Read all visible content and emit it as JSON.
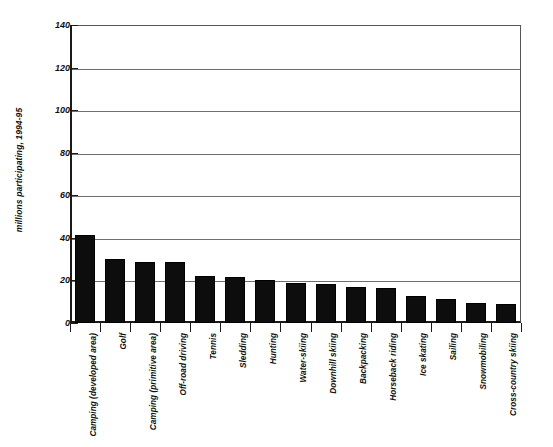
{
  "chart_data": {
    "type": "bar",
    "title": "",
    "xlabel": "",
    "ylabel": "millions participating, 1994-95",
    "ylim": [
      0,
      140
    ],
    "yticks": [
      0,
      20,
      40,
      60,
      80,
      100,
      120,
      140
    ],
    "ytick_labels": [
      "0",
      "20",
      "40",
      "60",
      "80",
      "100",
      "120",
      "140"
    ],
    "grid": "horizontal",
    "legend": "none",
    "orientation": "vertical",
    "bar_color": "#0d0d0d",
    "categories": [
      "Camping (developed area)",
      "Golf",
      "Camping (primitive area)",
      "Off-road driving",
      "Tennis",
      "Sledding",
      "Hunting",
      "Water-skiing",
      "Downhill skiing",
      "Backpacking",
      "Horseback riding",
      "Ice skating",
      "Sailing",
      "Snowmobiling",
      "Cross-country skiing"
    ],
    "values": [
      41.5,
      30,
      28.5,
      28.5,
      22,
      21.5,
      20,
      19,
      18.5,
      17,
      16.5,
      12.5,
      11.5,
      9.5,
      9
    ]
  },
  "axes": {
    "y_title": "millions participating, 1994-95"
  }
}
